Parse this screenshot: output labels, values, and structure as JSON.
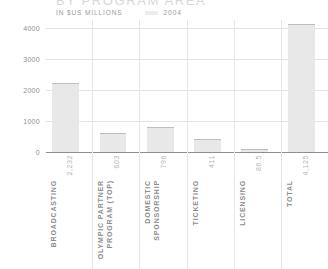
{
  "header": {
    "title": "BY PROGRAM AREA",
    "units": "IN $US MILLIONS",
    "year": "2004",
    "swatch_color": "#ededed"
  },
  "style": {
    "bar_fill": "#e8e8e8",
    "bar_top_line": "#bdbdbd",
    "gridline": "#e3e3e3",
    "baseline": "#8e8e8e",
    "label_color": "#8c8c8c",
    "value_color": "#b4b4b4"
  },
  "chart_data": {
    "type": "bar",
    "title": "BY PROGRAM AREA",
    "subtitle": "IN $US MILLIONS",
    "series_year": "2004",
    "xlabel": "",
    "ylabel": "",
    "ylim": [
      0,
      4000
    ],
    "yticks": [
      4000,
      3000,
      2000,
      1000,
      0
    ],
    "ytick_labels": [
      "4000",
      "3000",
      "2000",
      "1000",
      "0"
    ],
    "grid": true,
    "legend_position": "top",
    "categories": [
      "BROADCASTING",
      "OLYMPIC PARTNER PROGRAM (TOP)",
      "DOMESTIC SPONSORSHIP",
      "TICKETING",
      "LICENSING",
      "TOTAL"
    ],
    "category_lines": [
      [
        "BROADCASTING"
      ],
      [
        "OLYMPIC PARTNER",
        "PROGRAM (TOP)"
      ],
      [
        "DOMESTIC",
        "SPONSORSHIP"
      ],
      [
        "TICKETING"
      ],
      [
        "LICENSING"
      ],
      [
        "TOTAL"
      ]
    ],
    "values": [
      2232,
      603,
      796,
      411,
      86.5,
      4125
    ],
    "value_labels": [
      "2,232",
      "603",
      "796",
      "411",
      "86.5",
      "4,125"
    ]
  }
}
